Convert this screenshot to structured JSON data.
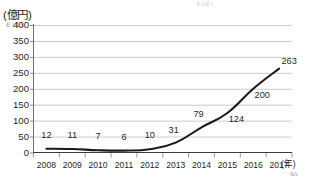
{
  "chart_data": {
    "type": "line",
    "title": "",
    "top_note": "きんがく",
    "ylabel": "(億円)",
    "ylabel_ruby": "おくえん",
    "xlabel": "(年)",
    "xlabel_ruby": "ねん",
    "categories": [
      "2008",
      "2009",
      "2010",
      "2011",
      "2012",
      "2013",
      "2014",
      "2015",
      "2016",
      "2017"
    ],
    "values": [
      12,
      11,
      7,
      6,
      10,
      31,
      79,
      124,
      200,
      263
    ],
    "point_labels": [
      "12",
      "11",
      "7",
      "6",
      "10",
      "31",
      "79",
      "124",
      "200",
      "263"
    ],
    "yticks": [
      "400",
      "350",
      "300",
      "250",
      "200",
      "150",
      "100",
      "50",
      "0"
    ],
    "ytick_values": [
      400,
      350,
      300,
      250,
      200,
      150,
      100,
      50,
      0
    ],
    "ylim": [
      0,
      400
    ],
    "grid": "horizontal",
    "legend": "none",
    "series_color": "#1a1a1a",
    "grid_color": "#b6b6b6",
    "axis_color": "#6e6e6e"
  }
}
